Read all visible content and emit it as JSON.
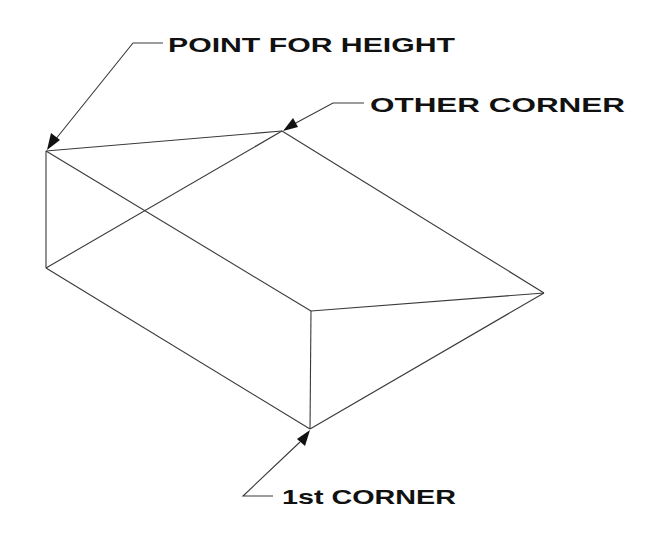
{
  "diagram": {
    "type": "isometric wireframe wedge / box",
    "labels": {
      "point_for_height": "POINT FOR HEIGHT",
      "other_corner": "OTHER CORNER",
      "first_corner": "1st CORNER"
    },
    "colors": {
      "line": "#3a3a3a",
      "text": "#111111",
      "background": "#ffffff"
    },
    "vertices": {
      "top_left": [
        46,
        151
      ],
      "top_right": [
        282,
        131
      ],
      "right": [
        544,
        293
      ],
      "middle": [
        311,
        311
      ],
      "bottom": [
        310,
        429
      ],
      "lower_left": [
        46,
        268
      ]
    }
  }
}
